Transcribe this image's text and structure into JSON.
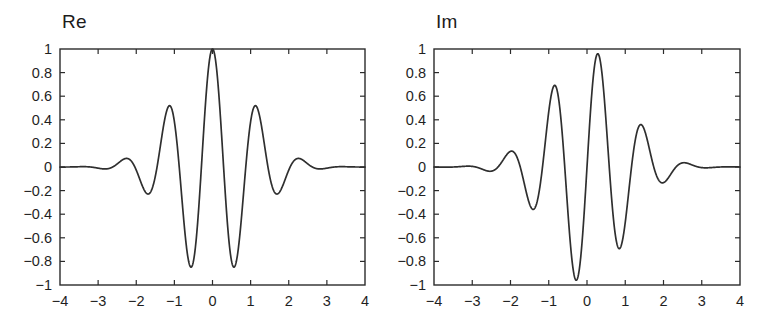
{
  "figure": {
    "background_color": "#ffffff",
    "line_color": "#2f2f2f",
    "axis_color": "#2b2b2b",
    "text_color": "#1f1f1f"
  },
  "panels": [
    {
      "id": "re",
      "title": "Re"
    },
    {
      "id": "im",
      "title": "Im"
    }
  ],
  "axis": {
    "xticks": [
      "-4",
      "-3",
      "-2",
      "-1",
      "0",
      "1",
      "2",
      "3",
      "4"
    ],
    "yticks": [
      "1",
      "0.8",
      "0.6",
      "0.4",
      "0.2",
      "0",
      "-0.2",
      "-0.4",
      "-0.6",
      "-0.8",
      "-1"
    ],
    "xlim": [
      -4,
      4
    ],
    "ylim": [
      -1,
      1
    ]
  },
  "chart_data": [
    {
      "type": "line",
      "title": "Re",
      "xlabel": "",
      "ylabel": "",
      "xlim": [
        -4,
        4
      ],
      "ylim": [
        -1,
        1
      ],
      "xticks": [
        -4,
        -3,
        -2,
        -1,
        0,
        1,
        2,
        3,
        4
      ],
      "yticks": [
        -1,
        -0.8,
        -0.6,
        -0.4,
        -0.2,
        0,
        0.2,
        0.4,
        0.6,
        0.8,
        1
      ],
      "grid": false,
      "legend": "none",
      "series": [
        {
          "name": "Re part of complex Morlet wavelet",
          "formula": "exp(-x^2/(2*s^2)) * cos(w*x)",
          "params": {
            "s": 1.0,
            "w": 5.4
          },
          "x": [
            -4.0,
            -3.8,
            -3.6,
            -3.4,
            -3.2,
            -3.0,
            -2.8,
            -2.6,
            -2.4,
            -2.2,
            -2.0,
            -1.8,
            -1.6,
            -1.4,
            -1.2,
            -1.0,
            -0.8,
            -0.6,
            -0.4,
            -0.2,
            0.0,
            0.2,
            0.4,
            0.6,
            0.8,
            1.0,
            1.2,
            1.4,
            1.6,
            1.8,
            2.0,
            2.2,
            2.4,
            2.6,
            2.8,
            3.0,
            3.2,
            3.4,
            3.6,
            3.8,
            4.0
          ],
          "y": [
            0.0,
            -0.0,
            -0.001,
            -0.002,
            -0.003,
            -0.002,
            0.004,
            0.018,
            0.038,
            0.043,
            -0.01,
            -0.162,
            -0.349,
            -0.346,
            0.116,
            0.45,
            -0.037,
            -0.794,
            -0.478,
            0.562,
            1.0,
            0.562,
            -0.478,
            -0.794,
            -0.037,
            0.45,
            0.116,
            -0.346,
            -0.349,
            -0.162,
            -0.01,
            0.043,
            0.038,
            0.018,
            0.004,
            -0.002,
            -0.003,
            -0.002,
            -0.001,
            -0.0,
            0.0
          ],
          "key_points": [
            {
              "x": 0.0,
              "y": 1.0,
              "label": "main peak"
            },
            {
              "x": -0.58,
              "y": -0.82,
              "label": "left trough"
            },
            {
              "x": 0.58,
              "y": -0.82,
              "label": "right trough"
            },
            {
              "x": -1.17,
              "y": 0.47,
              "label": "left side peak"
            },
            {
              "x": 1.17,
              "y": 0.47,
              "label": "right side peak"
            },
            {
              "x": -1.75,
              "y": -0.19,
              "label": "left outer dip"
            },
            {
              "x": 1.75,
              "y": -0.19,
              "label": "right outer dip"
            },
            {
              "x": -2.35,
              "y": 0.05,
              "label": "left outer bump"
            },
            {
              "x": 2.35,
              "y": 0.05,
              "label": "right outer bump"
            }
          ],
          "symmetry": "even"
        }
      ]
    },
    {
      "type": "line",
      "title": "Im",
      "xlabel": "",
      "ylabel": "",
      "xlim": [
        -4,
        4
      ],
      "ylim": [
        -1,
        1
      ],
      "xticks": [
        -4,
        -3,
        -2,
        -1,
        0,
        1,
        2,
        3,
        4
      ],
      "yticks": [
        -1,
        -0.8,
        -0.6,
        -0.4,
        -0.2,
        0,
        0.2,
        0.4,
        0.6,
        0.8,
        1
      ],
      "grid": false,
      "legend": "none",
      "series": [
        {
          "name": "Im part of complex Morlet wavelet",
          "formula": "exp(-x^2/(2*s^2)) * sin(w*x)",
          "params": {
            "s": 1.0,
            "w": 5.4
          },
          "x": [
            -4.0,
            -3.8,
            -3.6,
            -3.4,
            -3.2,
            -3.0,
            -2.8,
            -2.6,
            -2.4,
            -2.2,
            -2.0,
            -1.8,
            -1.6,
            -1.4,
            -1.2,
            -1.0,
            -0.8,
            -0.6,
            -0.4,
            -0.2,
            0.0,
            0.2,
            0.4,
            0.6,
            0.8,
            1.0,
            1.2,
            1.4,
            1.6,
            1.8,
            2.0,
            2.2,
            2.4,
            2.6,
            2.8,
            3.0,
            3.2,
            3.4,
            3.6,
            3.8,
            4.0
          ],
          "y": [
            0.0,
            0.001,
            0.001,
            0.001,
            -0.001,
            -0.005,
            -0.012,
            -0.017,
            -0.002,
            0.055,
            0.134,
            0.137,
            -0.041,
            -0.295,
            -0.283,
            0.208,
            0.641,
            0.262,
            -0.611,
            -0.92,
            0.0,
            0.92,
            0.611,
            -0.262,
            -0.641,
            -0.208,
            0.283,
            0.295,
            0.041,
            -0.137,
            -0.134,
            -0.055,
            0.002,
            0.017,
            0.012,
            0.005,
            0.001,
            -0.001,
            -0.001,
            -0.001,
            0.0
          ],
          "key_points": [
            {
              "x": 0.29,
              "y": 0.95,
              "label": "main peak"
            },
            {
              "x": -0.29,
              "y": -0.95,
              "label": "main trough"
            },
            {
              "x": -0.86,
              "y": 0.65,
              "label": "left side peak"
            },
            {
              "x": 0.86,
              "y": -0.65,
              "label": "right side trough"
            },
            {
              "x": -1.45,
              "y": -0.31,
              "label": "left outer trough"
            },
            {
              "x": 1.45,
              "y": 0.31,
              "label": "right outer peak"
            },
            {
              "x": -2.02,
              "y": 0.1,
              "label": "left small bump"
            },
            {
              "x": 2.02,
              "y": -0.1,
              "label": "right small dip"
            }
          ],
          "symmetry": "odd"
        }
      ]
    }
  ]
}
